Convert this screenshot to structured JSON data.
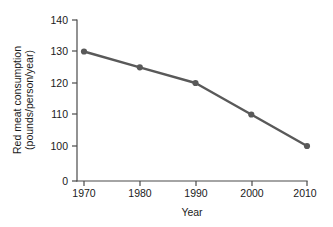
{
  "chart_data": {
    "type": "line",
    "title": "",
    "xlabel": "Year",
    "ylabel_line1": "Red meat consumption",
    "ylabel_line2": "(pounds/person/year)",
    "ylabel": "Red meat consumption (pounds/person/year)",
    "x": [
      1970,
      1980,
      1990,
      2000,
      2010
    ],
    "values": [
      130,
      125,
      120,
      110,
      100
    ],
    "categories": [
      "1970",
      "1980",
      "1990",
      "2000",
      "2010"
    ],
    "series": [
      {
        "name": "Red meat consumption",
        "values": [
          130,
          125,
          120,
          110,
          100
        ]
      }
    ],
    "xtick_labels": [
      "1970",
      "1980",
      "1990",
      "2000",
      "2010"
    ],
    "ytick_labels": [
      "140",
      "130",
      "120",
      "110",
      "100",
      "0"
    ],
    "ytick_values": [
      140,
      130,
      120,
      110,
      100,
      0
    ],
    "xlim": [
      1970,
      2010
    ],
    "ylim": [
      0,
      140
    ],
    "grid": false,
    "legend": false,
    "legend_position": "none",
    "marker": "circle",
    "axis_note": "y-axis compressed between 0 and 100",
    "colors": {
      "line": "#595959",
      "marker": "#595959",
      "axis": "#4a4a4a",
      "text": "#1a1a1a",
      "background": "#ffffff"
    }
  }
}
